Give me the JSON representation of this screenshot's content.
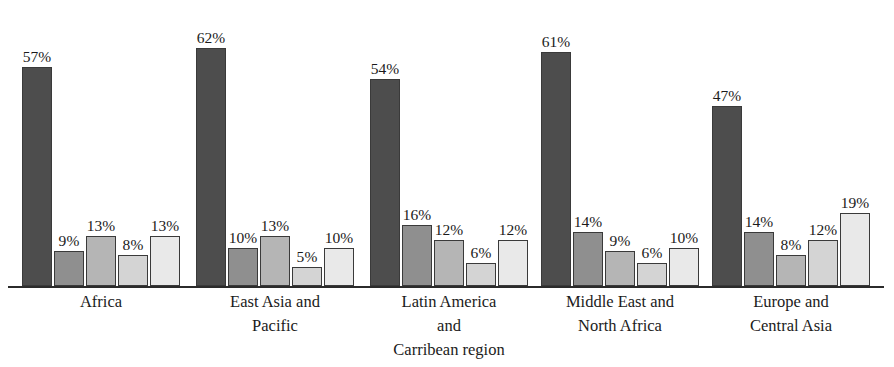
{
  "chart_data": {
    "type": "bar",
    "title": "",
    "xlabel": "",
    "ylabel": "",
    "ylim": [
      0,
      65
    ],
    "grid": false,
    "legend": "none",
    "value_label_suffix": "%",
    "categories": [
      "Africa",
      "East Asia and Pacific",
      "Latin America and Carribean region",
      "Middle East and North Africa",
      "Europe and Central Asia"
    ],
    "category_label_lines": [
      [
        "Africa"
      ],
      [
        "East Asia and",
        "Pacific"
      ],
      [
        "Latin America",
        "and",
        "Carribean region"
      ],
      [
        "Middle East and",
        "North Africa"
      ],
      [
        "Europe and",
        "Central Asia"
      ]
    ],
    "series": [
      {
        "name": "series-1",
        "color": "#4d4d4d",
        "values": [
          57,
          62,
          54,
          61,
          47
        ]
      },
      {
        "name": "series-2",
        "color": "#8f8f8f",
        "values": [
          9,
          10,
          16,
          14,
          14
        ]
      },
      {
        "name": "series-3",
        "color": "#b5b5b5",
        "values": [
          13,
          13,
          12,
          9,
          8
        ]
      },
      {
        "name": "series-4",
        "color": "#d4d4d4",
        "values": [
          8,
          5,
          6,
          6,
          12
        ]
      },
      {
        "name": "series-5",
        "color": "#e9e9e9",
        "values": [
          13,
          10,
          12,
          10,
          19
        ]
      }
    ],
    "value_labels": [
      [
        "57%",
        "9%",
        "13%",
        "8%",
        "13%"
      ],
      [
        "62%",
        "10%",
        "13%",
        "5%",
        "10%"
      ],
      [
        "54%",
        "16%",
        "12%",
        "6%",
        "12%"
      ],
      [
        "61%",
        "14%",
        "9%",
        "6%",
        "10%"
      ],
      [
        "47%",
        "14%",
        "8%",
        "12%",
        "19%"
      ]
    ]
  },
  "style": {
    "axis_color": "#2b2b2b",
    "bar_border_color": "#3a3a3a",
    "background": "#ffffff",
    "text_color": "#1b1b1b"
  },
  "layout": {
    "group_left_positions": [
      22,
      196,
      370,
      541,
      712
    ],
    "bar_pitch": 32,
    "bar_width": 30,
    "baseline_y": 286,
    "px_per_percent": 3.84,
    "label_offset": 19,
    "cat_label_centers": [
      101,
      275,
      449,
      620,
      791
    ],
    "cat_label_width": 200
  }
}
